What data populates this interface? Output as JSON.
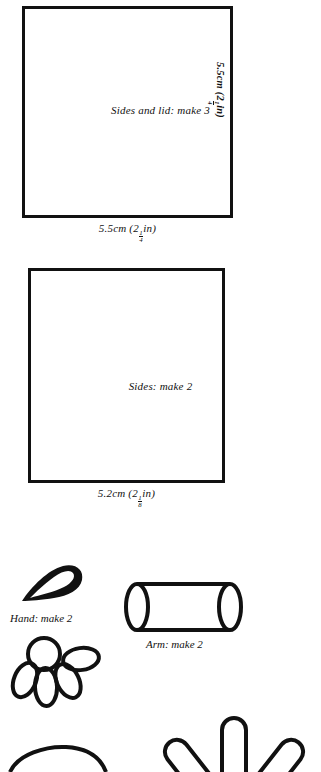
{
  "document": {
    "type": "sewing-pattern-sheet",
    "background_color": "#ffffff",
    "ink_color": "#111111"
  },
  "pieces": [
    {
      "id": "sides-and-lid",
      "label": "Sides and lid: make 3",
      "shape": "square",
      "width_label": {
        "metric": "5.5cm",
        "imperial_whole": "2",
        "imperial_numerator": "1",
        "imperial_denominator": "4",
        "imperial_unit": "in",
        "full": "5.5cm (2 1/4in)"
      },
      "height_label": {
        "metric": "5.5cm",
        "imperial_whole": "2",
        "imperial_numerator": "1",
        "imperial_denominator": "4",
        "imperial_unit": "in",
        "full": "5.5cm (2 1/4in)"
      }
    },
    {
      "id": "sides",
      "label": "Sides: make 2",
      "shape": "square",
      "width_label": {
        "metric": "5.2cm",
        "imperial_whole": "2",
        "imperial_numerator": "1",
        "imperial_denominator": "8",
        "imperial_unit": "in",
        "full": "5.2cm (2 1/8in)"
      }
    },
    {
      "id": "hand",
      "label": "Hand: make 2",
      "shape": "teardrop"
    },
    {
      "id": "arm",
      "label": "Arm: make 2",
      "shape": "cylinder"
    },
    {
      "id": "foot",
      "label": "",
      "shape": "circle-with-four-petals"
    },
    {
      "id": "fingers",
      "label": "",
      "shape": "five-rounded-spokes"
    }
  ]
}
